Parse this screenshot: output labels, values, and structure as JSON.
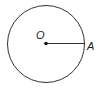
{
  "diagram": {
    "type": "circle-with-radius",
    "center_label": "O",
    "point_label": "A",
    "stroke_color": "#333333"
  }
}
